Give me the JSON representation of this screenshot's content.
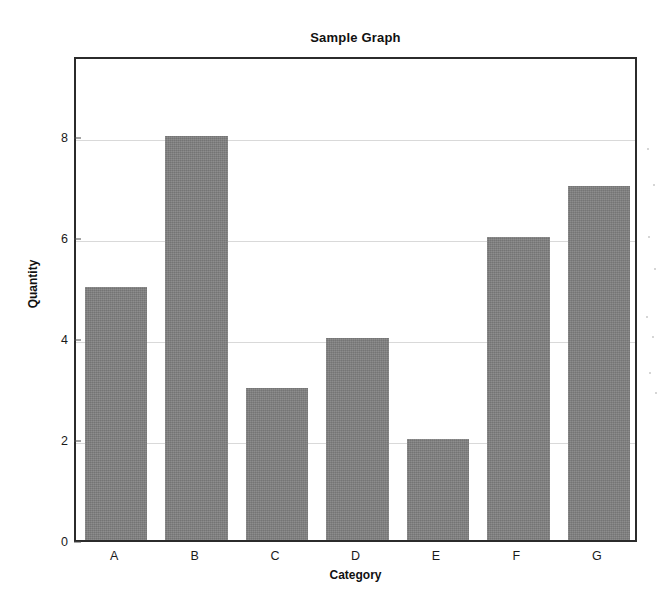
{
  "chart_data": {
    "type": "bar",
    "title": "Sample Graph",
    "xlabel": "Category",
    "ylabel": "Quantity",
    "categories": [
      "A",
      "B",
      "C",
      "D",
      "E",
      "F",
      "G"
    ],
    "values": [
      5,
      8,
      3,
      4,
      2,
      6,
      7
    ],
    "yticks": [
      0,
      2,
      4,
      6,
      8
    ],
    "ylim": [
      0,
      9.6
    ],
    "grid": true,
    "legend": false,
    "bar_color": "#808080",
    "frame_color": "#2b2b2b",
    "grid_color": "#d9d9d9",
    "background_color": "#ffffff"
  }
}
